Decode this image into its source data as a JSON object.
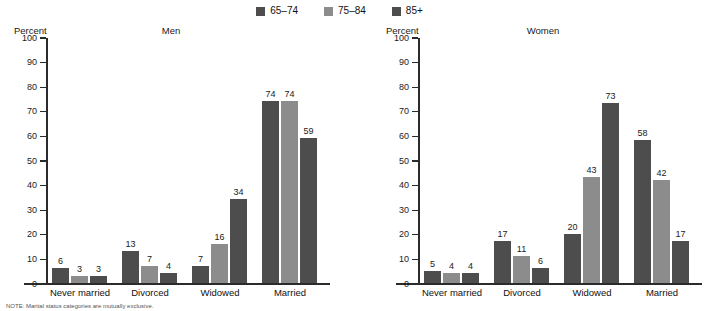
{
  "legend": {
    "items": [
      {
        "label": "65–74",
        "color": "#4d4d4d"
      },
      {
        "label": "75–84",
        "color": "#8c8c8c"
      },
      {
        "label": "85+",
        "color": "#4d4d4d"
      }
    ]
  },
  "footnote": {
    "text": "NOTE: Marital status categories are mutually exclusive."
  },
  "chart_data": [
    {
      "type": "bar",
      "title": "Men",
      "xlabel": "",
      "ylabel": "Percent",
      "ylim": [
        0,
        100
      ],
      "yticks": [
        0,
        10,
        20,
        30,
        40,
        50,
        60,
        70,
        80,
        90,
        100
      ],
      "grid": false,
      "legend_position": "top-center",
      "categories": [
        "Never married",
        "Divorced",
        "Widowed",
        "Married"
      ],
      "series": [
        {
          "name": "65–74",
          "color": "#4d4d4d",
          "values": [
            6,
            13,
            7,
            74
          ]
        },
        {
          "name": "75–84",
          "color": "#8c8c8c",
          "values": [
            3,
            7,
            16,
            74
          ]
        },
        {
          "name": "85+",
          "color": "#4d4d4d",
          "values": [
            3,
            4,
            34,
            59
          ]
        }
      ]
    },
    {
      "type": "bar",
      "title": "Women",
      "xlabel": "",
      "ylabel": "Percent",
      "ylim": [
        0,
        100
      ],
      "yticks": [
        0,
        10,
        20,
        30,
        40,
        50,
        60,
        70,
        80,
        90,
        100
      ],
      "grid": false,
      "legend_position": "top-center",
      "categories": [
        "Never married",
        "Divorced",
        "Widowed",
        "Married"
      ],
      "series": [
        {
          "name": "65–74",
          "color": "#4d4d4d",
          "values": [
            5,
            17,
            20,
            58
          ]
        },
        {
          "name": "75–84",
          "color": "#8c8c8c",
          "values": [
            4,
            11,
            43,
            42
          ]
        },
        {
          "name": "85+",
          "color": "#4d4d4d",
          "values": [
            4,
            6,
            73,
            17
          ]
        }
      ]
    }
  ]
}
